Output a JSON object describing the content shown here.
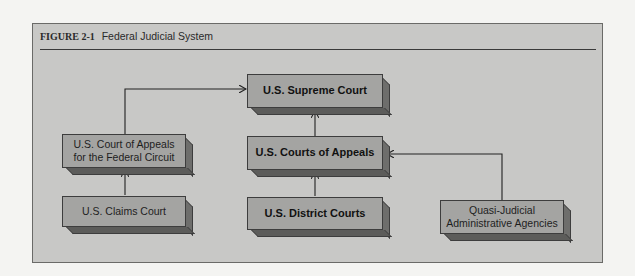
{
  "figure": {
    "label": "FIGURE 2-1",
    "title": "Federal Judicial System"
  },
  "nodes": {
    "supreme_court": "U.S. Supreme Court",
    "courts_of_appeals": "U.S. Courts of Appeals",
    "district_courts": "U.S. District Courts",
    "federal_circuit_line1": "U.S. Court of Appeals",
    "federal_circuit_line2": "for the Federal Circuit",
    "claims_court": "U.S. Claims Court",
    "agencies_line1": "Quasi-Judicial",
    "agencies_line2": "Administrative Agencies"
  },
  "edges": [
    {
      "from": "claims_court",
      "to": "federal_circuit"
    },
    {
      "from": "federal_circuit",
      "to": "supreme_court"
    },
    {
      "from": "courts_of_appeals",
      "to": "supreme_court"
    },
    {
      "from": "district_courts",
      "to": "courts_of_appeals"
    },
    {
      "from": "agencies",
      "to": "courts_of_appeals"
    }
  ]
}
